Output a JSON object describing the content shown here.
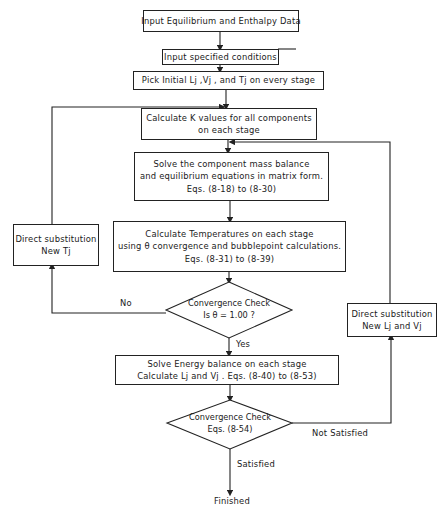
{
  "flowchart": {
    "nodes": {
      "input_data": {
        "label": "Input Equilibrium and Enthalpy Data"
      },
      "input_conditions": {
        "label": "Input specified conditions"
      },
      "pick_initial": {
        "label": "Pick Initial Lj ,Vj , and Tj on every stage"
      },
      "calc_k": {
        "line1": "Calculate K values for all components",
        "line2": "on each stage"
      },
      "solve_mass": {
        "line1": "Solve the component mass balance",
        "line2": "and equilibrium equations in matrix form.",
        "line3": "Eqs. (8-18) to (8-30)"
      },
      "calc_temp": {
        "line1": "Calculate Temperatures on each stage",
        "line2": "using θ convergence and bubblepoint calculations.",
        "line3": "Eqs. (8-31) to (8-39)"
      },
      "conv_check_1": {
        "line1": "Convergence Check",
        "line2": "Is θ = 1.00 ?"
      },
      "direct_sub_t": {
        "line1": "Direct substitution",
        "line2": "New Tj"
      },
      "solve_energy": {
        "line1": "Solve Energy balance on each stage",
        "line2": "Calculate Lj and Vj . Eqs. (8-40) to (8-53)"
      },
      "conv_check_2": {
        "line1": "Convergence Check",
        "line2": "Eqs. (8-54)"
      },
      "direct_sub_lv": {
        "line1": "Direct substitution",
        "line2": "New Lj and Vj"
      },
      "finished": {
        "label": "Finished"
      }
    },
    "edge_labels": {
      "no": "No",
      "yes": "Yes",
      "not_satisfied": "Not Satisfied",
      "satisfied": "Satisfied"
    }
  }
}
